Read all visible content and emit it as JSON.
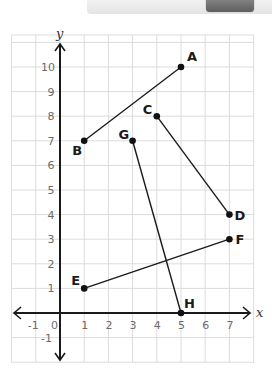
{
  "banner": {
    "visible": true
  },
  "chart_data": {
    "type": "scatter",
    "title": "",
    "xlabel": "x",
    "ylabel": "y",
    "xlim": [
      -2,
      8
    ],
    "ylim": [
      -2,
      11.3
    ],
    "grid": true,
    "x_ticks": [
      "-1",
      "0",
      "1",
      "2",
      "3",
      "4",
      "5",
      "6",
      "7"
    ],
    "y_ticks": [
      "-1",
      "1",
      "2",
      "3",
      "4",
      "5",
      "6",
      "7",
      "8",
      "9",
      "10"
    ],
    "points": [
      {
        "label": "A",
        "x": 5,
        "y": 10,
        "label_dx": 6,
        "label_dy": -6
      },
      {
        "label": "B",
        "x": 1,
        "y": 7,
        "label_dx": -12,
        "label_dy": 14
      },
      {
        "label": "C",
        "x": 4,
        "y": 8,
        "label_dx": -14,
        "label_dy": -2
      },
      {
        "label": "D",
        "x": 7,
        "y": 4,
        "label_dx": 5,
        "label_dy": 5
      },
      {
        "label": "E",
        "x": 1,
        "y": 1,
        "label_dx": -13,
        "label_dy": -3
      },
      {
        "label": "F",
        "x": 7,
        "y": 3,
        "label_dx": 6,
        "label_dy": 5
      },
      {
        "label": "G",
        "x": 3,
        "y": 7,
        "label_dx": -14,
        "label_dy": -2
      },
      {
        "label": "H",
        "x": 5,
        "y": 0,
        "label_dx": 3,
        "label_dy": -5
      }
    ],
    "segments": [
      [
        "A",
        "B"
      ],
      [
        "C",
        "D"
      ],
      [
        "E",
        "F"
      ],
      [
        "G",
        "H"
      ]
    ],
    "colors": {
      "grid": "#dcdcdc",
      "axis": "#1a1a1a",
      "segment": "#1a1a1a",
      "tick": "#6b6b6b"
    }
  }
}
